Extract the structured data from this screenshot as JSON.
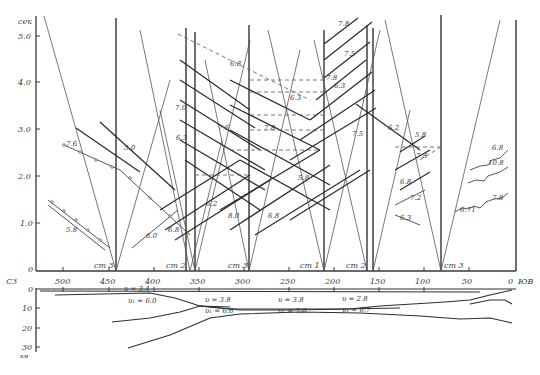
{
  "figure": {
    "upper_panel": {
      "y_axis": {
        "unit": "сек",
        "ticks": [
          "5.0",
          "4.0",
          "3.0",
          "2.0",
          "1.0",
          "0"
        ]
      },
      "x_axis": {
        "left_label": "СЗ",
        "right_label": "ЮВ",
        "ticks": [
          "500",
          "450",
          "400",
          "350",
          "300",
          "250",
          "200",
          "150",
          "100",
          "50",
          "0"
        ]
      },
      "stations": [
        "ст 3",
        "ст 2",
        "ст 3",
        "ст 1",
        "ст 2",
        "ст 3"
      ],
      "curve_labels": {
        "left_group": [
          "7.6",
          "5.0",
          "5.8",
          "6.0",
          "6.8"
        ],
        "center_group": [
          "6.8",
          "7.0",
          "6.3",
          "7.6",
          "7.8",
          "6.2",
          "8.0",
          "6.8",
          "5.8",
          "6.3"
        ],
        "upper_right_group": [
          "7.8",
          "7.5",
          "7.8",
          "6.3",
          "7.5",
          "6.2"
        ],
        "right_group": [
          "5.8",
          "7.8",
          "6.8",
          "7.2",
          "6.3"
        ],
        "far_right_group": [
          "6.8",
          "10.8",
          "7.8",
          "6.71"
        ]
      }
    },
    "lower_panel": {
      "y_axis": {
        "unit": "км",
        "ticks": [
          "0",
          "10",
          "20",
          "30"
        ]
      },
      "layer_labels": [
        "υ = 3.4",
        "υ₁ = 6.0",
        "υ = 3.8",
        "υ₁ = 6.6",
        "υ = 3.8",
        "υ₁ = 7.0",
        "υ = 2.8",
        "υ₁ = 6.7"
      ]
    }
  }
}
